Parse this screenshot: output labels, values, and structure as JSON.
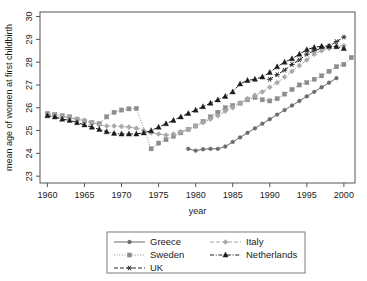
{
  "figure": {
    "width": 367,
    "height": 281,
    "background": "#ffffff"
  },
  "chart_data": {
    "type": "line",
    "title": "",
    "xlabel": "year",
    "ylabel": "mean age of women at first childbirth",
    "xlim": [
      1959,
      2001.5
    ],
    "ylim": [
      22.7,
      30.2
    ],
    "xticks": [
      1960,
      1965,
      1970,
      1975,
      1980,
      1985,
      1990,
      1995,
      2000
    ],
    "yticks": [
      23,
      24,
      25,
      26,
      27,
      28,
      29,
      30
    ],
    "grid": false,
    "legend_position": "below",
    "series": [
      {
        "name": "Greece",
        "color": "#6b6b6b",
        "marker": "circle",
        "dash": "none",
        "x": [
          1979,
          1980,
          1981,
          1982,
          1983,
          1984,
          1985,
          1986,
          1987,
          1988,
          1989,
          1990,
          1991,
          1992,
          1993,
          1994,
          1995,
          1996,
          1997,
          1998,
          1999
        ],
        "values": [
          24.2,
          24.12,
          24.18,
          24.2,
          24.2,
          24.3,
          24.5,
          24.7,
          24.9,
          25.1,
          25.3,
          25.5,
          25.7,
          25.9,
          26.1,
          26.3,
          26.5,
          26.7,
          26.9,
          27.1,
          27.3
        ]
      },
      {
        "name": "Sweden",
        "color": "#8c8c8c",
        "marker": "square",
        "dash": "dotted",
        "x": [
          1960,
          1961,
          1962,
          1963,
          1964,
          1965,
          1966,
          1967,
          1968,
          1969,
          1970,
          1971,
          1972,
          1974,
          1975,
          1976,
          1977,
          1978,
          1979,
          1980,
          1981,
          1982,
          1983,
          1984,
          1985,
          1986,
          1987,
          1988,
          1989,
          1990,
          1991,
          1992,
          1993,
          1994,
          1995,
          1996,
          1997,
          1998,
          1999,
          2000,
          2001
        ],
        "values": [
          25.75,
          25.7,
          25.65,
          25.6,
          25.5,
          25.42,
          25.35,
          25.3,
          25.6,
          25.8,
          25.9,
          25.95,
          25.97,
          24.2,
          24.45,
          24.6,
          24.75,
          24.9,
          25.05,
          25.2,
          25.4,
          25.6,
          25.8,
          26.0,
          26.1,
          26.2,
          26.35,
          26.45,
          26.35,
          26.3,
          26.4,
          26.6,
          26.8,
          27.0,
          27.1,
          27.25,
          27.4,
          27.6,
          27.8,
          27.9,
          28.2
        ]
      },
      {
        "name": "UK",
        "color": "#2b2b2b",
        "marker": "star",
        "dash": "dashed",
        "x": [
          1990,
          1991,
          1992,
          1993,
          1994,
          1995,
          1996,
          1997,
          1998,
          1999,
          2000
        ],
        "values": [
          27.25,
          27.45,
          27.65,
          27.9,
          28.1,
          28.35,
          28.5,
          28.6,
          28.7,
          28.9,
          29.1
        ]
      },
      {
        "name": "Italy",
        "color": "#a8a8a8",
        "marker": "diamond",
        "dash": "dashed",
        "x": [
          1960,
          1961,
          1962,
          1963,
          1964,
          1965,
          1966,
          1967,
          1968,
          1969,
          1970,
          1971,
          1972,
          1973,
          1974,
          1975,
          1976,
          1977,
          1978,
          1979,
          1980,
          1981,
          1982,
          1983,
          1984,
          1985,
          1986,
          1987,
          1988,
          1989,
          1990,
          1991,
          1992,
          1993,
          1994,
          1995,
          1996,
          1997,
          1998,
          1999,
          2000
        ],
        "values": [
          25.7,
          25.65,
          25.6,
          25.55,
          25.5,
          25.45,
          25.35,
          25.25,
          25.2,
          25.2,
          25.18,
          25.15,
          25.1,
          25.0,
          24.9,
          24.85,
          24.8,
          24.85,
          24.95,
          25.05,
          25.2,
          25.35,
          25.5,
          25.65,
          25.85,
          26.0,
          26.2,
          26.4,
          26.55,
          26.7,
          26.9,
          27.1,
          27.35,
          27.6,
          27.85,
          28.1,
          28.35,
          28.5,
          28.6,
          28.7,
          28.72
        ]
      },
      {
        "name": "Netherlands",
        "color": "#1a1a1a",
        "marker": "triangle",
        "dash": "dashdot",
        "x": [
          1960,
          1961,
          1962,
          1963,
          1964,
          1965,
          1966,
          1967,
          1968,
          1969,
          1970,
          1971,
          1972,
          1973,
          1974,
          1975,
          1976,
          1977,
          1978,
          1979,
          1980,
          1981,
          1982,
          1983,
          1984,
          1985,
          1986,
          1987,
          1988,
          1989,
          1990,
          1991,
          1992,
          1993,
          1994,
          1995,
          1996,
          1997,
          1998,
          1999,
          2000
        ],
        "values": [
          25.65,
          25.6,
          25.5,
          25.45,
          25.35,
          25.25,
          25.15,
          25.05,
          24.95,
          24.88,
          24.85,
          24.85,
          24.85,
          24.9,
          25.0,
          25.15,
          25.3,
          25.45,
          25.6,
          25.75,
          25.9,
          26.05,
          26.2,
          26.35,
          26.5,
          26.7,
          27.05,
          27.2,
          27.25,
          27.35,
          27.55,
          27.8,
          28.0,
          28.15,
          28.35,
          28.55,
          28.65,
          28.7,
          28.7,
          28.68,
          28.6
        ]
      }
    ]
  },
  "legend": {
    "entries": [
      {
        "label": "Greece"
      },
      {
        "label": "Italy"
      },
      {
        "label": "Sweden"
      },
      {
        "label": "Netherlands"
      },
      {
        "label": "UK"
      }
    ]
  }
}
